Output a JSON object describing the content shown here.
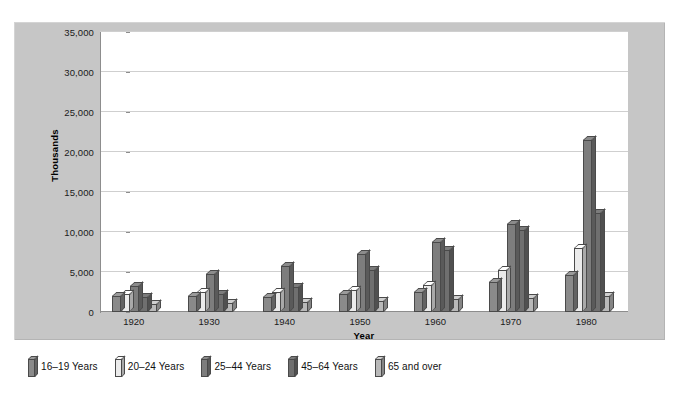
{
  "figure": {
    "frame_color": "#c6c6c6",
    "plot_background": "#ffffff",
    "gridline_color": "#cfcfcf",
    "axis_color": "#8d8d8d"
  },
  "chart_data": {
    "type": "bar",
    "title": "",
    "subtitle": "",
    "xlabel": "Year",
    "ylabel": "Thousands",
    "categories": [
      "1920",
      "1930",
      "1940",
      "1950",
      "1960",
      "1970",
      "1980"
    ],
    "ylim": [
      0,
      35000
    ],
    "ytick_values": [
      0,
      5000,
      10000,
      15000,
      20000,
      25000,
      30000,
      35000
    ],
    "ytick_labels": [
      "0",
      "5,000",
      "10,000",
      "15,000",
      "20,000",
      "25,000",
      "30,000",
      "35,000"
    ],
    "grid": "horizontal",
    "legend_position": "below-figure",
    "style": "3d-grouped-columns",
    "series": [
      {
        "name": "16–19 Years",
        "color": "#8a8a8a",
        "values": [
          2000,
          2000,
          1900,
          2300,
          2500,
          3800,
          4600
        ]
      },
      {
        "name": "20–24 Years",
        "color": "#ebebeb",
        "values": [
          2200,
          2500,
          2500,
          2800,
          3400,
          5200,
          8000
        ]
      },
      {
        "name": "25–44 Years",
        "color": "#7d7d7d",
        "values": [
          3300,
          4800,
          5700,
          7300,
          8800,
          11000,
          21500
        ]
      },
      {
        "name": "45–64 Years",
        "color": "#6f6f6f",
        "values": [
          1900,
          2200,
          3100,
          5300,
          7800,
          10300,
          12400
        ]
      },
      {
        "name": "65 and over",
        "color": "#b9b9b9",
        "values": [
          1000,
          1100,
          1300,
          1400,
          1600,
          1800,
          2000
        ]
      }
    ]
  },
  "legend": {
    "items": [
      {
        "label": "16–19 Years",
        "color": "#8a8a8a"
      },
      {
        "label": "20–24 Years",
        "color": "#ebebeb"
      },
      {
        "label": "25–44 Years",
        "color": "#7d7d7d"
      },
      {
        "label": "45–64 Years",
        "color": "#6f6f6f"
      },
      {
        "label": "65 and over",
        "color": "#b9b9b9"
      }
    ]
  }
}
